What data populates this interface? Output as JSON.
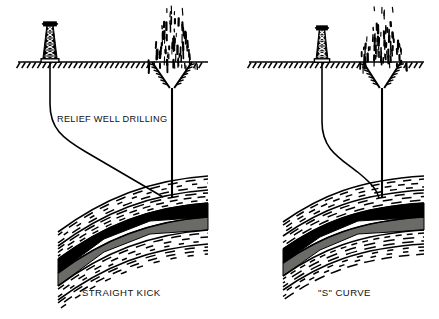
{
  "figure": {
    "kind": "technical-line-diagram",
    "background_color": "#ffffff",
    "ink_color": "#000000"
  },
  "annotations": {
    "relief_well_drilling_label": "RELIEF WELL DRILLING"
  },
  "panels": [
    {
      "id": "straight-kick",
      "caption": "STRAIGHT KICK",
      "caption_x": 82,
      "caption_y": 296,
      "origin_x": 0,
      "ground_line_y": 62,
      "ground_x1": 18,
      "ground_x2": 208,
      "derrick": {
        "base_x": 50,
        "base_y": 62,
        "height": 36,
        "base_half_width": 7.5,
        "top_half_width": 3.2,
        "crown_width": 13,
        "label": "drilling-derrick"
      },
      "blowout": {
        "well_x": 172,
        "crater_half_width": 20,
        "crater_depth": 26,
        "plume_top_y": 16,
        "label": "blowout-plume"
      },
      "blown_well_path": "M 172 88 L 172 198",
      "relief_well_path": "M 50 62 L 50 104 C 50 128, 62 138, 86 152 L 163 197",
      "strata": {
        "top_edge": "M 58 232 C 104 198, 150 180, 208 176",
        "band_offsets": [
          0,
          14,
          27,
          41,
          54,
          68
        ],
        "reservoir_top_offset": 27,
        "reservoir_black_thickness": 14,
        "reservoir_gray_thickness": 13,
        "gray_color": "#6a6a66"
      }
    },
    {
      "id": "s-curve",
      "caption": "\"S\" CURVE",
      "caption_x": 318,
      "caption_y": 296,
      "origin_x": 231,
      "ground_line_y": 62,
      "ground_x1": 249,
      "ground_x2": 424,
      "derrick": {
        "base_x": 322,
        "base_y": 62,
        "height": 32,
        "base_half_width": 6.2,
        "top_half_width": 2.8,
        "crown_width": 11,
        "label": "drilling-derrick"
      },
      "blowout": {
        "well_x": 382,
        "crater_half_width": 19,
        "crater_depth": 26,
        "plume_top_y": 18,
        "label": "blowout-plume"
      },
      "blown_well_path": "M 382 88 L 382 198",
      "relief_well_path": "M 322 62 L 322 122 C 322 150, 340 158, 360 174 C 372 184, 377 190, 379 198",
      "strata": {
        "top_edge": "M 283 222 C 320 196, 358 180, 424 176",
        "band_offsets": [
          0,
          14,
          27,
          41,
          54,
          68
        ],
        "reservoir_top_offset": 27,
        "reservoir_black_thickness": 14,
        "reservoir_gray_thickness": 13,
        "gray_color": "#6a6a66"
      }
    }
  ]
}
